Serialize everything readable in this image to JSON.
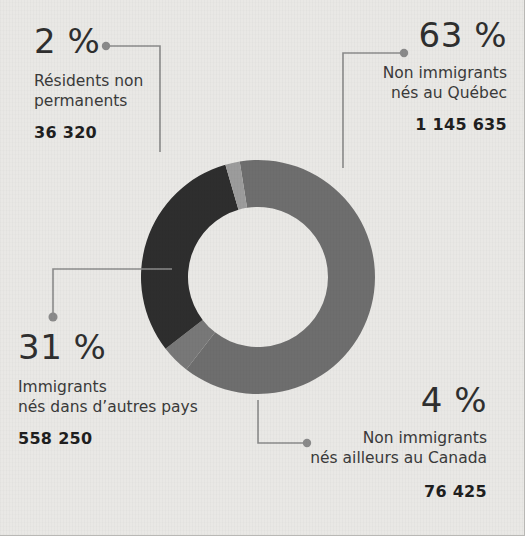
{
  "background_color": "#e9e8e5",
  "chart_data": {
    "type": "pie",
    "title": "",
    "subtitle": "",
    "xlabel": "",
    "ylabel": "",
    "legend_position": "callouts",
    "donut": true,
    "inner_radius_ratio": 0.6,
    "categories": [
      "Non immigrants nés au Québec",
      "Non immigrants nés ailleurs au Canada",
      "Immigrants nés dans d’autres pays",
      "Résidents non permanents"
    ],
    "values": [
      1145635,
      76425,
      558250,
      36320
    ],
    "percents": [
      63,
      4,
      31,
      2
    ],
    "colors": [
      "#6e6e6e",
      "#787878",
      "#2e2e2e",
      "#9c9c9c"
    ],
    "annotations": [
      "63 % — Non immigrants nés au Québec — 1 145 635",
      "4 % — Non immigrants nés ailleurs au Canada — 76 425",
      "31 % — Immigrants nés dans d’autres pays — 558 250",
      "2 % — Résidents non permanents — 36 320"
    ]
  },
  "callouts": {
    "nonpermanent": {
      "percent": "2 %",
      "desc_line1": "Résidents non",
      "desc_line2": "permanents",
      "count": "36 320",
      "color": "#9c9c9c"
    },
    "quebec": {
      "percent": "63 %",
      "desc_line1": "Non immigrants",
      "desc_line2": "nés au Québec",
      "count": "1 145 635",
      "color": "#6e6e6e"
    },
    "immigrants": {
      "percent": "31 %",
      "desc_line1": "Immigrants",
      "desc_line2": "nés dans d’autres pays",
      "count": "558 250",
      "color": "#2e2e2e"
    },
    "canada": {
      "percent": "4 %",
      "desc_line1": "Non immigrants",
      "desc_line2": "nés ailleurs au Canada",
      "count": "76 425",
      "color": "#787878"
    }
  },
  "leader_line_color": "#8a8a8a"
}
